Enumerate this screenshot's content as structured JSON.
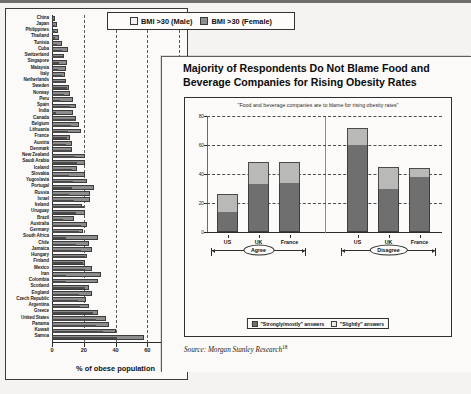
{
  "left_chart": {
    "x_axis_title": "% of obese population",
    "x_ticks": [
      "0",
      "20",
      "40",
      "60",
      "80"
    ],
    "legend": [
      {
        "label": "BMI >30 (Male)",
        "swatch": "male",
        "color": "#f1f1ef"
      },
      {
        "label": "BMI >30 (Female)",
        "swatch": "female",
        "color": "#8e8e8e"
      }
    ]
  },
  "right_panel": {
    "title": "Majority of Respondents Do Not Blame Food and Beverage Companies for Rising Obesity Rates",
    "chart_subtitle": "\"Food and beverage companies are to blame for rising obesity rates\"",
    "group_labels": [
      "Agree",
      "Disagree"
    ],
    "legend": [
      {
        "label": "\"Strongly/mostly\" answers",
        "swatch": "strong",
        "color": "#6f6f6f"
      },
      {
        "label": "\"Slightly\" answers",
        "swatch": "slight",
        "color": "#ededeb"
      }
    ],
    "source": "Source: Morgan Stanley Research",
    "source_footnote": "18"
  },
  "chart_data": [
    {
      "type": "bar",
      "orientation": "horizontal",
      "title": "",
      "xlabel": "% of obese population",
      "ylabel": "",
      "xlim": [
        0,
        80
      ],
      "xticks": [
        0,
        20,
        40,
        60,
        80
      ],
      "grid": true,
      "legend_position": "top",
      "categories": [
        "China",
        "Japan",
        "Philippines",
        "Thailand",
        "Tunisia",
        "Cuba",
        "Switzerland",
        "Singapore",
        "Malaysia",
        "Italy",
        "Netherlands",
        "Sweden",
        "Norway",
        "Peru",
        "Spain",
        "India",
        "Canada",
        "Belgium",
        "Lithuania",
        "France",
        "Austria",
        "Denmark",
        "New Zealand",
        "Saudi Arabia",
        "Iceland",
        "Slovakia",
        "Yugoslavia",
        "Portugal",
        "Russia",
        "Israel",
        "Ireland",
        "Uruguay",
        "Brazil",
        "Australia",
        "Germany",
        "South Africa",
        "Chile",
        "Jamaica",
        "Hungary",
        "Finland",
        "Mexico",
        "Iran",
        "Colombia",
        "Scotland",
        "England",
        "Czech Republic",
        "Argentina",
        "Greece",
        "United States",
        "Panama",
        "Kuwait",
        "Samoa"
      ],
      "series": [
        {
          "name": "BMI >30 (Male)",
          "values": [
            1.2,
            1.8,
            1.6,
            2.0,
            3.0,
            6.5,
            6.8,
            4.5,
            4.0,
            6.5,
            8.4,
            9.5,
            7.8,
            4.8,
            11.5,
            2.5,
            15.0,
            12.1,
            10.0,
            9.6,
            9.1,
            11.8,
            14.7,
            16.0,
            12.4,
            11.0,
            13.0,
            12.9,
            10.8,
            14.0,
            20.0,
            15.0,
            6.9,
            18.2,
            17.2,
            9.0,
            15.0,
            18.0,
            21.0,
            19.8,
            20.5,
            9.0,
            8.8,
            20.8,
            17.0,
            16.3,
            17.5,
            26.0,
            27.7,
            27.9,
            32.0,
            41.0
          ]
        },
        {
          "name": "BMI >30 (Female)",
          "values": [
            1.6,
            2.9,
            3.8,
            4.5,
            6.5,
            10.0,
            7.5,
            9.5,
            9.0,
            8.5,
            9.0,
            10.5,
            11.4,
            13.5,
            15.0,
            13.0,
            15.0,
            17.0,
            18.0,
            11.5,
            12.8,
            12.5,
            20.6,
            21.0,
            15.7,
            21.0,
            22.0,
            26.5,
            24.0,
            24.0,
            19.0,
            21.0,
            14.1,
            22.0,
            19.3,
            29.0,
            23.0,
            25.0,
            22.0,
            21.0,
            25.5,
            31.0,
            29.0,
            23.0,
            25.5,
            21.3,
            23.0,
            29.0,
            34.0,
            36.0,
            40.0,
            58.0
          ]
        }
      ]
    },
    {
      "type": "bar",
      "orientation": "vertical",
      "stacked": true,
      "title": "Majority of Respondents Do Not Blame Food and Beverage Companies for Rising Obesity Rates",
      "subtitle": "\"Food and beverage companies are to blame for rising obesity rates\"",
      "xlabel": "",
      "ylabel": "",
      "ylim": [
        0,
        80
      ],
      "yticks": [
        0,
        20,
        40,
        60,
        80
      ],
      "grid": true,
      "legend_position": "bottom",
      "groups": [
        {
          "name": "Agree",
          "categories": [
            "US",
            "UK",
            "France"
          ]
        },
        {
          "name": "Disagree",
          "categories": [
            "US",
            "UK",
            "France"
          ]
        }
      ],
      "categories": [
        "US",
        "UK",
        "France",
        "US",
        "UK",
        "France"
      ],
      "series": [
        {
          "name": "\"Strongly/mostly\" answers",
          "values": [
            14,
            33,
            34,
            60,
            30,
            38
          ]
        },
        {
          "name": "\"Slightly\" answers",
          "values": [
            12,
            15,
            14,
            12,
            15,
            6
          ]
        }
      ],
      "totals": [
        26,
        48,
        48,
        72,
        45,
        44
      ]
    }
  ]
}
